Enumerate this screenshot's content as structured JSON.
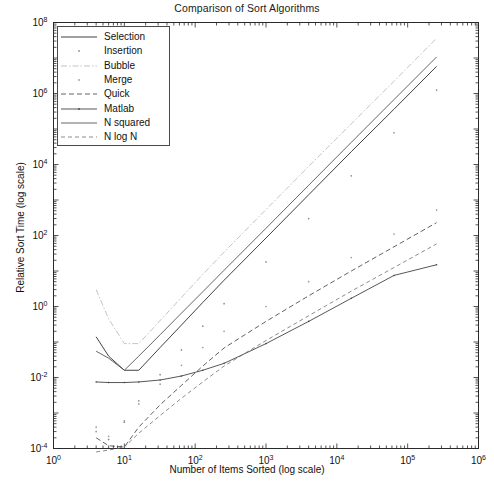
{
  "chart_data": {
    "type": "line",
    "title": "Comparison of Sort Algorithms",
    "xlabel": "Number of Items Sorted (log scale)",
    "ylabel": "Relative Sort Time (log scale)",
    "xscale": "log",
    "yscale": "log",
    "xlim": [
      1,
      1000000
    ],
    "ylim": [
      0.0001,
      100000000
    ],
    "grid": false,
    "legend_position": "upper left",
    "xticks": [
      {
        "value": 1,
        "label": "10",
        "exponent": "0"
      },
      {
        "value": 10,
        "label": "10",
        "exponent": "1"
      },
      {
        "value": 100,
        "label": "10",
        "exponent": "2"
      },
      {
        "value": 1000,
        "label": "10",
        "exponent": "3"
      },
      {
        "value": 10000,
        "label": "10",
        "exponent": "4"
      },
      {
        "value": 100000,
        "label": "10",
        "exponent": "5"
      },
      {
        "value": 1000000,
        "label": "10",
        "exponent": "6"
      }
    ],
    "yticks": [
      {
        "value": 0.0001,
        "label": "10",
        "exponent": "-4"
      },
      {
        "value": 0.01,
        "label": "10",
        "exponent": "-2"
      },
      {
        "value": 1,
        "label": "10",
        "exponent": "0"
      },
      {
        "value": 100,
        "label": "10",
        "exponent": "2"
      },
      {
        "value": 10000,
        "label": "10",
        "exponent": "4"
      },
      {
        "value": 1000000,
        "label": "10",
        "exponent": "6"
      },
      {
        "value": 100000000,
        "label": "10",
        "exponent": "8"
      }
    ],
    "series": [
      {
        "name": "Selection",
        "style": "solid",
        "color": "#2b2b2b",
        "x": [
          4,
          6,
          10,
          16,
          32,
          64,
          128,
          256,
          1000,
          4000,
          16000,
          64000,
          256000
        ],
        "y": [
          0.14,
          0.04,
          0.016,
          0.016,
          0.07,
          0.3,
          1.3,
          5.5,
          85,
          1400,
          23000,
          360000,
          5800000
        ]
      },
      {
        "name": "Insertion",
        "style": "dotted-marker",
        "color": "#8d8d8d",
        "x": [
          4,
          6,
          10,
          16,
          32,
          64,
          128,
          256,
          1000,
          4000,
          16000,
          64000,
          256000
        ],
        "y": [
          0.0003,
          0.00018,
          0.00055,
          0.0022,
          0.012,
          0.06,
          0.28,
          1.2,
          18,
          300,
          4800,
          78000,
          1250000
        ]
      },
      {
        "name": "Bubble",
        "style": "dashdot-light",
        "color": "#b4b4b4",
        "x": [
          4,
          6,
          10,
          16,
          32,
          64,
          128,
          256,
          1000,
          4000,
          16000,
          64000,
          256000
        ],
        "y": [
          3.0,
          0.45,
          0.09,
          0.09,
          0.4,
          1.8,
          8.0,
          34,
          540,
          8800,
          140000,
          2200000,
          36000000
        ]
      },
      {
        "name": "Merge",
        "style": "dotted-marker",
        "color": "#9a9a9a",
        "x": [
          4,
          6,
          10,
          16,
          32,
          64,
          128,
          256,
          1000,
          4000,
          16000,
          64000,
          256000
        ],
        "y": [
          0.0004,
          0.00022,
          0.0006,
          0.0018,
          0.0065,
          0.022,
          0.07,
          0.2,
          1.0,
          5.0,
          24,
          110,
          520
        ]
      },
      {
        "name": "Quick",
        "style": "dashed",
        "color": "#3a3a3a",
        "x": [
          4,
          6,
          10,
          16,
          32,
          64,
          128,
          256,
          1000,
          4000,
          16000,
          64000,
          256000
        ],
        "y": [
          0.0002,
          0.00012,
          0.00011,
          0.0004,
          0.0017,
          0.006,
          0.021,
          0.068,
          0.38,
          2.0,
          10.0,
          48,
          230
        ]
      },
      {
        "name": "Matlab",
        "style": "solid-marker",
        "color": "#444444",
        "x": [
          4,
          6,
          10,
          16,
          32,
          64,
          128,
          256,
          1000,
          4000,
          16000,
          64000,
          256000
        ],
        "y": [
          0.0075,
          0.0072,
          0.0072,
          0.0075,
          0.0085,
          0.011,
          0.016,
          0.025,
          0.09,
          0.38,
          1.7,
          7.5,
          15.0
        ]
      },
      {
        "name": "N squared",
        "style": "solid",
        "color": "#555555",
        "x": [
          4,
          6,
          10,
          16,
          32,
          64,
          128,
          256,
          1000,
          4000,
          16000,
          64000,
          256000
        ],
        "y": [
          0.055,
          0.035,
          0.016,
          0.04,
          0.16,
          0.65,
          2.6,
          10.5,
          160,
          2600,
          42000,
          670000,
          10700000
        ]
      },
      {
        "name": "N log N",
        "style": "dashed-light",
        "color": "#6e6e6e",
        "x": [
          4,
          6,
          10,
          16,
          32,
          64,
          128,
          256,
          1000,
          4000,
          16000,
          64000,
          256000
        ],
        "y": [
          8e-05,
          9e-05,
          0.00011,
          0.00027,
          0.00085,
          0.0026,
          0.0075,
          0.021,
          0.11,
          0.55,
          2.7,
          12.5,
          58
        ]
      }
    ]
  },
  "legend": {
    "items": [
      {
        "label": "Selection"
      },
      {
        "label": "Insertion"
      },
      {
        "label": "Bubble"
      },
      {
        "label": "Merge"
      },
      {
        "label": "Quick"
      },
      {
        "label": "Matlab"
      },
      {
        "label": "N squared"
      },
      {
        "label": "N log N"
      }
    ]
  }
}
